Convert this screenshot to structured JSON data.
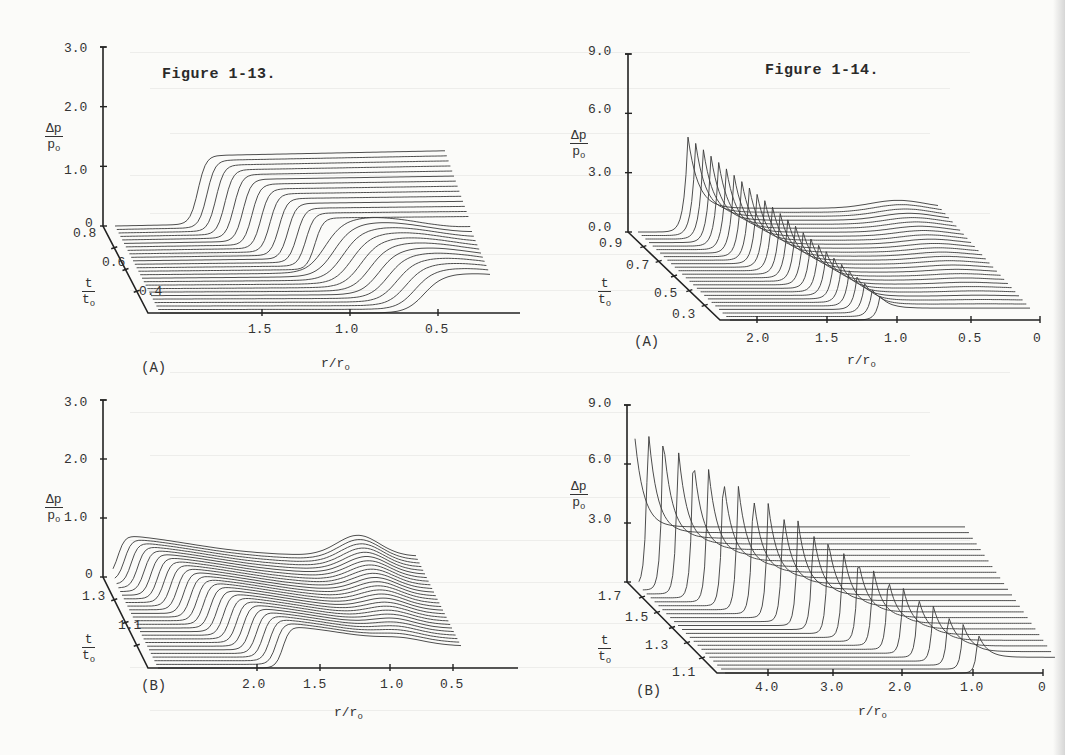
{
  "page": {
    "figures": [
      {
        "id": "fig-1-13",
        "title": "Figure 1-13."
      },
      {
        "id": "fig-1-14",
        "title": "Figure 1-14."
      }
    ]
  },
  "chart_data": [
    {
      "id": "fig-1-13-A",
      "figure": "Figure 1-13.",
      "panel_label": "(A)",
      "type": "waterfall-3d-line",
      "zlabel": "Δp/p_o",
      "zlabel_num": "Δp",
      "zlabel_den": "p",
      "ylabel_num": "t",
      "ylabel_den": "t",
      "xlabel": "r/r_o",
      "xlabel_text": "r/r",
      "z_ticks": [
        "3.0",
        "2.0",
        "1.0",
        "0"
      ],
      "z_range": [
        0,
        3.0
      ],
      "t_ticks": [
        "0.8",
        "0.6",
        "0.4"
      ],
      "t_range": [
        0.3,
        0.8
      ],
      "r_ticks": [
        "1.5",
        "1.0",
        "0.5"
      ],
      "r_range": [
        2.0,
        0.0
      ],
      "n_traces": 26,
      "description": "Pressure pulse Δp/p_o vs radius r/r_o for successive times t/t_o; plateau ~1.2 behind front, front moves outward with time",
      "plateau_level": 1.2,
      "front_r_at_t_min": 0.45,
      "front_r_at_t_max": 1.7
    },
    {
      "id": "fig-1-13-B",
      "figure": "Figure 1-13.",
      "panel_label": "(B)",
      "type": "waterfall-3d-line",
      "zlabel": "Δp/p_o",
      "zlabel_num": "Δp",
      "zlabel_den": "p",
      "ylabel_num": "t",
      "ylabel_den": "t",
      "xlabel": "r/r_o",
      "xlabel_text": "r/r",
      "z_ticks": [
        "3.0",
        "2.0",
        "1.0",
        "0"
      ],
      "z_range": [
        0,
        3.0
      ],
      "t_ticks": [
        "1.3",
        "1.1"
      ],
      "t_range": [
        0.9,
        1.4
      ],
      "r_ticks": [
        "2.0",
        "1.5",
        "1.0",
        "0.5"
      ],
      "r_range": [
        2.5,
        0.0
      ],
      "n_traces": 26,
      "description": "Later times: front near r/r_o 1.4-2.3, amplitude ~0.8 decaying, central region dip",
      "plateau_level": 0.8,
      "front_r_at_t_min": 1.4,
      "front_r_at_t_max": 2.35
    },
    {
      "id": "fig-1-14-A",
      "figure": "Figure 1-14.",
      "panel_label": "(A)",
      "type": "waterfall-3d-line",
      "zlabel": "Δp/p_o",
      "zlabel_num": "Δp",
      "zlabel_den": "p",
      "ylabel_num": "t",
      "ylabel_den": "t",
      "xlabel": "r/r_o",
      "xlabel_text": "r/r",
      "z_ticks": [
        "9.0",
        "6.0",
        "3.0",
        "0.0"
      ],
      "z_range": [
        0,
        9.0
      ],
      "t_ticks": [
        "0.9",
        "0.7",
        "0.5",
        "0.3"
      ],
      "t_range": [
        0.25,
        0.95
      ],
      "r_ticks": [
        "2.0",
        "1.5",
        "1.0",
        "0.5",
        "0"
      ],
      "r_range": [
        2.5,
        0.0
      ],
      "n_traces": 26,
      "description": "Shock front peaks rising from ~2.0 at early time to ~4.8 at latest time, front travels from r/r_o 0.45 to 2.3",
      "peak_at_t_min": 1.6,
      "peak_at_t_max": 4.8,
      "front_r_at_t_min": 0.45,
      "front_r_at_t_max": 2.3
    },
    {
      "id": "fig-1-14-B",
      "figure": "Figure 1-14.",
      "panel_label": "(B)",
      "type": "waterfall-3d-line",
      "zlabel": "Δp/p_o",
      "zlabel_num": "Δp",
      "zlabel_den": "p",
      "ylabel_num": "t",
      "ylabel_den": "t",
      "xlabel": "r/r_o",
      "xlabel_text": "r/r",
      "z_ticks": [
        "9.0",
        "6.0",
        "3.0"
      ],
      "z_range": [
        0,
        9.0
      ],
      "t_ticks": [
        "1.7",
        "1.5",
        "1.3",
        "1.1"
      ],
      "t_range": [
        1.05,
        1.75
      ],
      "r_ticks": [
        "4.0",
        "3.0",
        "2.0",
        "1.0",
        "0"
      ],
      "r_range": [
        4.8,
        0.0
      ],
      "n_traces": 24,
      "description": "Strong converging shock: peaks from ~8.5 at latest time down to ~2.0, front from r/r_o 2.2 to 4.6, flat interior ~0.8-2.8",
      "peak_at_t_min": 1.8,
      "peak_at_t_max": 8.4,
      "front_r_at_t_min": 2.2,
      "front_r_at_t_max": 4.6
    }
  ]
}
